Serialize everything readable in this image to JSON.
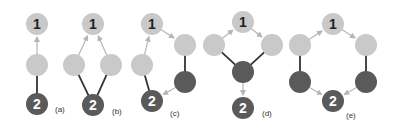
{
  "colors": {
    "light_node": "#c9c9c9",
    "dark_node": "#5a5a5a",
    "label_on_light": "#222222",
    "label_on_dark": "#ffffff",
    "solid_edge": "#333333",
    "arrow_edge": "#b5b5b5"
  },
  "graphs": [
    {
      "label": "(a)",
      "label_pos": [
        55,
        112
      ],
      "nodes": [
        {
          "id": "n1",
          "x": 37,
          "y": 24,
          "type": "light",
          "text": "1"
        },
        {
          "id": "m",
          "x": 37,
          "y": 65,
          "type": "light",
          "text": ""
        },
        {
          "id": "n2",
          "x": 37,
          "y": 104,
          "type": "dark",
          "text": "2"
        }
      ],
      "edges": [
        {
          "from": "m",
          "to": "n1",
          "kind": "arrow"
        },
        {
          "from": "n2",
          "to": "m",
          "kind": "solid"
        }
      ]
    },
    {
      "label": "(b)",
      "label_pos": [
        112,
        114
      ],
      "nodes": [
        {
          "id": "n1",
          "x": 93,
          "y": 24,
          "type": "light",
          "text": "1"
        },
        {
          "id": "l",
          "x": 74,
          "y": 65,
          "type": "light",
          "text": ""
        },
        {
          "id": "r",
          "x": 111,
          "y": 65,
          "type": "light",
          "text": ""
        },
        {
          "id": "n2",
          "x": 93,
          "y": 105,
          "type": "dark",
          "text": "2"
        }
      ],
      "edges": [
        {
          "from": "l",
          "to": "n1",
          "kind": "arrow"
        },
        {
          "from": "r",
          "to": "n1",
          "kind": "arrow"
        },
        {
          "from": "n2",
          "to": "l",
          "kind": "solid"
        },
        {
          "from": "n2",
          "to": "r",
          "kind": "solid"
        }
      ]
    },
    {
      "label": "(c)",
      "label_pos": [
        170,
        116
      ],
      "nodes": [
        {
          "id": "n1",
          "x": 152,
          "y": 24,
          "type": "light",
          "text": "1"
        },
        {
          "id": "l",
          "x": 142,
          "y": 65,
          "type": "light",
          "text": ""
        },
        {
          "id": "rt",
          "x": 185,
          "y": 45,
          "type": "light",
          "text": ""
        },
        {
          "id": "rb",
          "x": 185,
          "y": 82,
          "type": "dark",
          "text": ""
        },
        {
          "id": "n2",
          "x": 152,
          "y": 101,
          "type": "dark",
          "text": "2"
        }
      ],
      "edges": [
        {
          "from": "l",
          "to": "n1",
          "kind": "arrow"
        },
        {
          "from": "n1",
          "to": "rt",
          "kind": "arrow"
        },
        {
          "from": "n2",
          "to": "l",
          "kind": "solid"
        },
        {
          "from": "rt",
          "to": "rb",
          "kind": "solid"
        },
        {
          "from": "rb",
          "to": "n2",
          "kind": "arrow"
        }
      ]
    },
    {
      "label": "(d)",
      "label_pos": [
        262,
        116
      ],
      "nodes": [
        {
          "id": "n1",
          "x": 243,
          "y": 22,
          "type": "light",
          "text": "1"
        },
        {
          "id": "l",
          "x": 214,
          "y": 45,
          "type": "light",
          "text": ""
        },
        {
          "id": "r",
          "x": 272,
          "y": 45,
          "type": "light",
          "text": ""
        },
        {
          "id": "c",
          "x": 243,
          "y": 72,
          "type": "dark",
          "text": ""
        },
        {
          "id": "n2",
          "x": 243,
          "y": 108,
          "type": "dark",
          "text": "2"
        }
      ],
      "edges": [
        {
          "from": "l",
          "to": "n1",
          "kind": "arrow"
        },
        {
          "from": "n1",
          "to": "r",
          "kind": "arrow"
        },
        {
          "from": "l",
          "to": "c",
          "kind": "solid"
        },
        {
          "from": "r",
          "to": "c",
          "kind": "solid"
        },
        {
          "from": "c",
          "to": "n2",
          "kind": "arrow"
        }
      ]
    },
    {
      "label": "(e)",
      "label_pos": [
        346,
        118
      ],
      "nodes": [
        {
          "id": "n1",
          "x": 333,
          "y": 24,
          "type": "light",
          "text": "1"
        },
        {
          "id": "lt",
          "x": 300,
          "y": 45,
          "type": "light",
          "text": ""
        },
        {
          "id": "rt",
          "x": 366,
          "y": 45,
          "type": "light",
          "text": ""
        },
        {
          "id": "lb",
          "x": 300,
          "y": 82,
          "type": "dark",
          "text": ""
        },
        {
          "id": "rb",
          "x": 366,
          "y": 82,
          "type": "dark",
          "text": ""
        },
        {
          "id": "n2",
          "x": 333,
          "y": 101,
          "type": "dark",
          "text": "2"
        }
      ],
      "edges": [
        {
          "from": "lt",
          "to": "n1",
          "kind": "arrow"
        },
        {
          "from": "n1",
          "to": "rt",
          "kind": "arrow"
        },
        {
          "from": "lt",
          "to": "lb",
          "kind": "solid"
        },
        {
          "from": "rt",
          "to": "rb",
          "kind": "solid"
        },
        {
          "from": "lb",
          "to": "n2",
          "kind": "arrow"
        },
        {
          "from": "rb",
          "to": "n2",
          "kind": "arrow"
        }
      ]
    }
  ]
}
